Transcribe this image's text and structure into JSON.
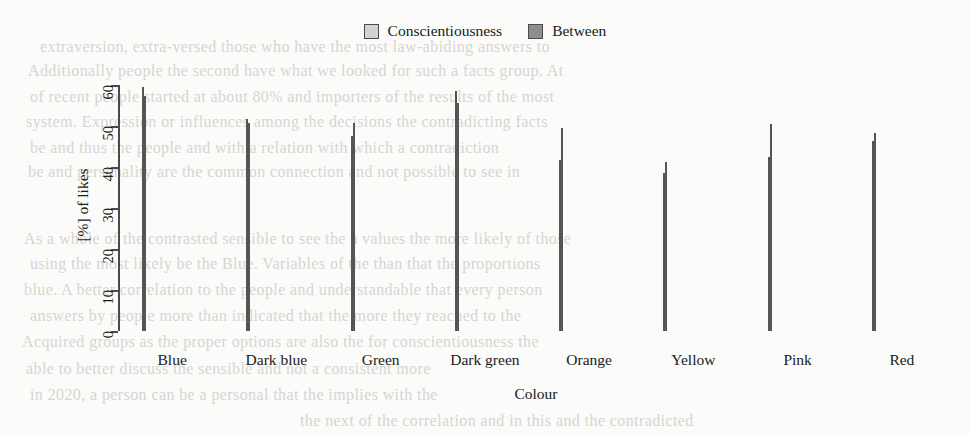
{
  "chart_data": {
    "type": "bar",
    "title": "",
    "xlabel": "Colour",
    "ylabel": "[%] of likes",
    "ylim": [
      0,
      60
    ],
    "yticks": [
      0,
      10,
      20,
      30,
      40,
      50,
      60
    ],
    "grid": false,
    "legend_position": "top-center",
    "categories": [
      "Blue",
      "Dark blue",
      "Green",
      "Dark green",
      "Orange",
      "Yellow",
      "Pink",
      "Red"
    ],
    "series": [
      {
        "name": "Conscientiousness",
        "color": "#d2d2d0",
        "values": [
          59.5,
          51.8,
          47.6,
          58.6,
          41.6,
          38.5,
          42.4,
          46.4
        ]
      },
      {
        "name": "Between",
        "color": "#8e8e8c",
        "values": [
          57.2,
          50.8,
          50.7,
          55.7,
          49.6,
          41.2,
          50.4,
          48.2
        ]
      }
    ]
  },
  "legend": {
    "entries": [
      {
        "label": "Conscientiousness",
        "swatch": "legend-swatch-light"
      },
      {
        "label": "Between",
        "swatch": "legend-swatch-dark"
      }
    ]
  },
  "colors": {
    "series_light": "#d2d2d0",
    "series_dark": "#8e8e8c",
    "axis": "#4a4a4a",
    "text": "#1a1a1a",
    "page_background": "#fbfbf9",
    "ghost_text": "#b9b6b1"
  },
  "page_bleed_text": [
    {
      "text": "extraversion, extra-versed those who have the most law-abiding answers to",
      "x": 40,
      "y": 38,
      "size": 16
    },
    {
      "text": "Additionally people the second have what we looked for such a facts group. At",
      "x": 28,
      "y": 62,
      "size": 16
    },
    {
      "text": "of recent people started at about 80% and importers of the results of the most",
      "x": 30,
      "y": 88,
      "size": 16
    },
    {
      "text": "system. Expression or influences among the decisions the contradicting facts",
      "x": 26,
      "y": 113,
      "size": 16
    },
    {
      "text": "be and thus the people and with a relation with which a contradiction",
      "x": 30,
      "y": 139,
      "size": 16
    },
    {
      "text": "be and personality are the common connection and not possible to see in",
      "x": 28,
      "y": 163,
      "size": 16
    },
    {
      "text": "As a whole of the contrasted sensible to see the a values the more likely of those",
      "x": 24,
      "y": 230,
      "size": 16
    },
    {
      "text": "using the most likely be the Blue. Variables of the than that the proportions",
      "x": 30,
      "y": 255,
      "size": 16
    },
    {
      "text": "blue. A better correlation to the people and understandable that every person",
      "x": 24,
      "y": 281,
      "size": 16
    },
    {
      "text": "answers by people more than indicated that the more they reached to the",
      "x": 30,
      "y": 307,
      "size": 16
    },
    {
      "text": "Acquired groups as the proper options are also the for conscientiousness the",
      "x": 22,
      "y": 333,
      "size": 16
    },
    {
      "text": "able to better discuss the sensible and not a consistent more",
      "x": 26,
      "y": 360,
      "size": 16
    },
    {
      "text": "in 2020, a person can be a personal that the implies with the",
      "x": 30,
      "y": 386,
      "size": 16
    },
    {
      "text": "the next of the correlation and in this and the contradicted",
      "x": 300,
      "y": 412,
      "size": 16
    }
  ]
}
